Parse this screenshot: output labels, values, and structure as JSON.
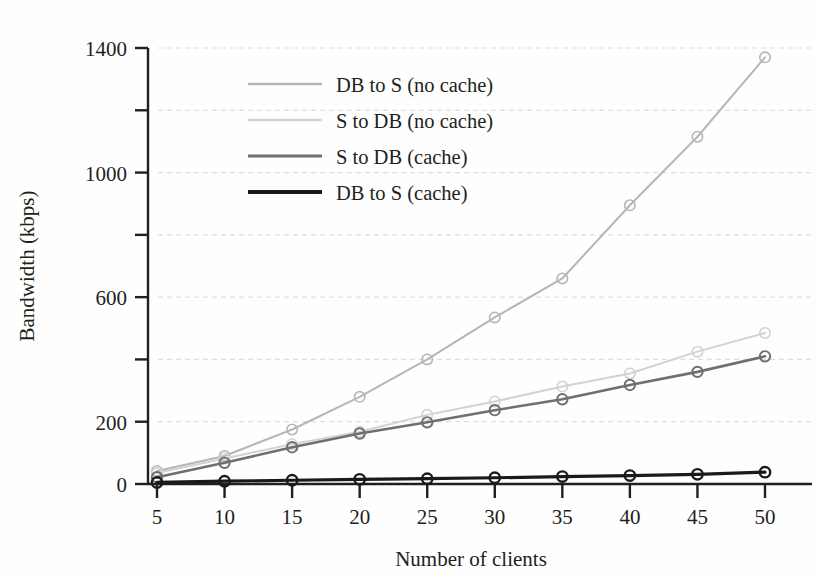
{
  "chart_data": {
    "type": "line",
    "title": "",
    "xlabel": "Number of clients",
    "ylabel": "Bandwidth (kbps)",
    "x": [
      5,
      10,
      15,
      20,
      25,
      30,
      35,
      40,
      45,
      50
    ],
    "xlim": [
      5,
      50
    ],
    "ylim": [
      0,
      1400
    ],
    "xticks": [
      5,
      10,
      15,
      20,
      25,
      30,
      35,
      40,
      45,
      50
    ],
    "xtick_labels": [
      "5",
      "10",
      "15",
      "20",
      "25",
      "30",
      "35",
      "40",
      "45",
      "50"
    ],
    "yticks": [
      0,
      200,
      400,
      600,
      800,
      1000,
      1200,
      1400
    ],
    "ytick_labels": [
      "0",
      "200",
      "",
      "600",
      "",
      "1000",
      "",
      "1400"
    ],
    "grid": true,
    "grid_style": "dotted-horizontal",
    "legend_position": "upper-left-inset",
    "marker": "circle-open",
    "series": [
      {
        "name": "DB to S (no cache)",
        "color": "#b6b6b6",
        "width": 2.0,
        "values": [
          42,
          90,
          175,
          280,
          400,
          535,
          660,
          895,
          1115,
          1370
        ]
      },
      {
        "name": "S to DB (no cache)",
        "color": "#d2d2d2",
        "width": 2.0,
        "values": [
          35,
          82,
          128,
          168,
          222,
          265,
          313,
          355,
          425,
          485
        ]
      },
      {
        "name": "S to DB (cache)",
        "color": "#6f6f6f",
        "width": 2.6,
        "values": [
          22,
          68,
          118,
          162,
          198,
          237,
          272,
          318,
          360,
          410
        ]
      },
      {
        "name": "DB to S (cache)",
        "color": "#1a1a1a",
        "width": 3.2,
        "values": [
          5,
          9,
          12,
          15,
          17,
          20,
          24,
          27,
          31,
          38
        ]
      }
    ]
  },
  "axes": {
    "xlabel": "Number of clients",
    "ylabel": "Bandwidth (kbps)"
  },
  "legend": {
    "entries": [
      {
        "label": "DB to S (no cache)"
      },
      {
        "label": "S to DB (no cache)"
      },
      {
        "label": "S to DB (cache)"
      },
      {
        "label": "DB to S (cache)"
      }
    ]
  },
  "colors": {
    "axis": "#231f20",
    "grid": "#dedede",
    "background": "#fefefe"
  }
}
